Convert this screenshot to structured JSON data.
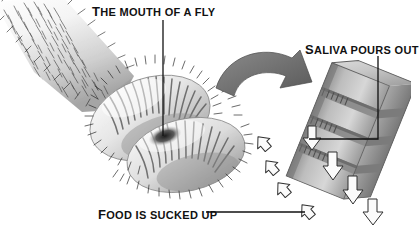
{
  "figure": {
    "background_color": "#ffffff",
    "ink_color": "#111111"
  },
  "labels": {
    "mouth": {
      "text": "THE MOUTH OF A FLY",
      "lead_word": "T",
      "rest": "HE MOUTH OF A FLY"
    },
    "saliva": {
      "text": "SALIVA POURS OUT",
      "lead_word": "S",
      "rest": "ALIVA POURS OUT"
    },
    "food": {
      "text": "FOOD IS SUCKED UP",
      "lead_word": "F",
      "rest": "OOD IS SUCKED UP"
    }
  },
  "colors": {
    "hair_dark": "#2e2e2e",
    "body_light": "#f2f2f2",
    "body_mid": "#c9c9c9",
    "body_shadow": "#8f8f8f",
    "arrow_gray": "#7c7c7c",
    "arrow_gray_dark": "#5e5e5e",
    "tube_light": "#d9d9d9",
    "tube_mid": "#b5b5b5",
    "tube_dark": "#909090",
    "tube_shadow": "#6e6e6e",
    "outline": "#3a3a3a",
    "white_arrow_fill": "#fbfbfb"
  },
  "annotations": {
    "mouth_pointer": "vertical leader line from label down into mouth center",
    "saliva_pointer": "vertical then left-turning leader line to pseudotrachea",
    "food_pointer": "horizontal leader line to up-right food arrow",
    "curved_arrow": "thick gray curved arrow from labellum to pseudotrachea diagram",
    "saliva_arrows_count": 4,
    "food_arrows_count": 5
  }
}
